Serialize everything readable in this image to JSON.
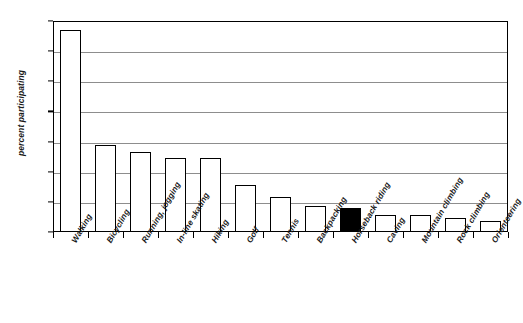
{
  "chart_data": {
    "type": "bar",
    "title": "",
    "xlabel": "",
    "ylabel": "percent participating",
    "ylim": [
      0,
      70
    ],
    "grid": true,
    "legend": "none",
    "ytick_labels": [
      "0%",
      "10%",
      "20%",
      "30%",
      "40%",
      "50%",
      "60%",
      "70%"
    ],
    "ytick_values": [
      0,
      10,
      20,
      30,
      40,
      50,
      60,
      70
    ],
    "categories": [
      "Walking",
      "Bicycling",
      "Running, jogging",
      "In-line skating",
      "Hiking",
      "Golf",
      "Tennis",
      "Backpacking",
      "Horseback riding",
      "Caving",
      "Mountain climbing",
      "Rock climbing",
      "Orienteering"
    ],
    "values": [
      67,
      29,
      26.5,
      24.5,
      24.5,
      15.5,
      11.5,
      8.5,
      8,
      5.5,
      5.5,
      4.5,
      3.5
    ],
    "highlight_index": 8,
    "highlight_color": "#000000",
    "bar_fill_color": "#ffffff",
    "bar_edge_color": "#000000",
    "gridline_color": "#8d8d8d",
    "axis_color": "#000000",
    "background_color": "#ffffff"
  }
}
